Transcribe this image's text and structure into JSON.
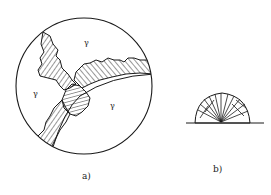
{
  "figure": {
    "panel_a": {
      "label": "a)",
      "phase_labels": [
        "γ",
        "γ",
        "γ"
      ]
    },
    "panel_b": {
      "label": "b)"
    }
  },
  "colors": {
    "ink": "#1a1a1a",
    "background": "#ffffff"
  }
}
